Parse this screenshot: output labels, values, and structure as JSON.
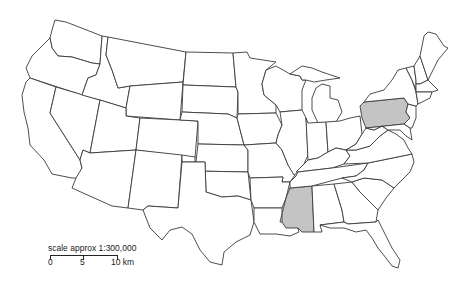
{
  "map": {
    "region": "Contiguous United States",
    "highlight_color": "#c4c4c4",
    "border_color": "#3a3a3a",
    "highlighted_states": [
      "Pennsylvania",
      "Mississippi"
    ]
  },
  "scale": {
    "title": "scale approx 1:300,000",
    "ticks": [
      "0",
      "5",
      "10 km"
    ]
  }
}
